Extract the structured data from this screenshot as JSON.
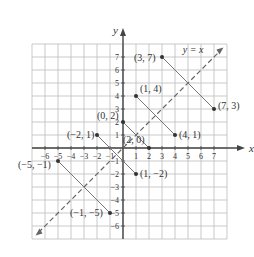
{
  "chart_data": {
    "type": "scatter",
    "title": "",
    "xlabel": "x",
    "ylabel": "y",
    "xlim": [
      -7,
      8
    ],
    "ylim": [
      -7,
      8
    ],
    "grid": true,
    "x_ticks": [
      -6,
      -5,
      -4,
      -3,
      -2,
      -1,
      1,
      2,
      3,
      4,
      5,
      6,
      7
    ],
    "y_ticks": [
      -6,
      -5,
      -4,
      -3,
      -2,
      -1,
      1,
      2,
      3,
      4,
      5,
      6,
      7
    ],
    "reference_line": {
      "label": "y = x",
      "style": "dashed",
      "from": [
        -6.5,
        -6.5
      ],
      "to": [
        7.5,
        7.5
      ]
    },
    "points": [
      {
        "label": "(3, 7)",
        "x": 3,
        "y": 7
      },
      {
        "label": "(7, 3)",
        "x": 7,
        "y": 3
      },
      {
        "label": "(1, 4)",
        "x": 1,
        "y": 4
      },
      {
        "label": "(4, 1)",
        "x": 4,
        "y": 1
      },
      {
        "label": "(0, 2)",
        "x": 0,
        "y": 2
      },
      {
        "label": "(2, 0)",
        "x": 2,
        "y": 0
      },
      {
        "label": "(−2, 1)",
        "x": -2,
        "y": 1
      },
      {
        "label": "(1, −2)",
        "x": 1,
        "y": -2
      },
      {
        "label": "(−5, −1)",
        "x": -5,
        "y": -1
      },
      {
        "label": "(−1, −5)",
        "x": -1,
        "y": -5
      }
    ],
    "segments": [
      [
        [
          3,
          7
        ],
        [
          7,
          3
        ]
      ],
      [
        [
          1,
          4
        ],
        [
          4,
          1
        ]
      ],
      [
        [
          0,
          2
        ],
        [
          2,
          0
        ]
      ],
      [
        [
          -2,
          1
        ],
        [
          1,
          -2
        ]
      ],
      [
        [
          -5,
          -1
        ],
        [
          -1,
          -5
        ]
      ]
    ]
  },
  "axes": {
    "x_label": "x",
    "y_label": "y"
  },
  "line_label": "y = x",
  "point_labels": [
    "(3, 7)",
    "(7, 3)",
    "(1, 4)",
    "(4, 1)",
    "(0, 2)",
    "(2, 0)",
    "(−2, 1)",
    "(1, −2)",
    "(−5, −1)",
    "(−1, −5)"
  ]
}
